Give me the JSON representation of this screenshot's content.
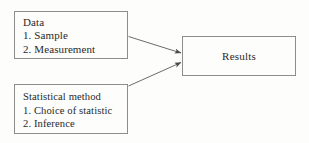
{
  "diagram": {
    "background_color": "#fdfdfc",
    "line_color": "#8d8d8d",
    "text_color": "#2a2a2a",
    "nodes": [
      {
        "id": "data",
        "lines": [
          "Data",
          "1. Sample",
          "2. Measurement"
        ]
      },
      {
        "id": "statistical-method",
        "lines": [
          "Statistical method",
          "1. Choice of statistic",
          "2. Inference"
        ]
      },
      {
        "id": "results",
        "label": "Results"
      }
    ],
    "edges": [
      {
        "id": "data-to-results",
        "from": "data",
        "to": "results",
        "style": "solid-arrow"
      },
      {
        "id": "method-to-results",
        "from": "statistical-method",
        "to": "results",
        "style": "solid-arrow"
      }
    ]
  }
}
